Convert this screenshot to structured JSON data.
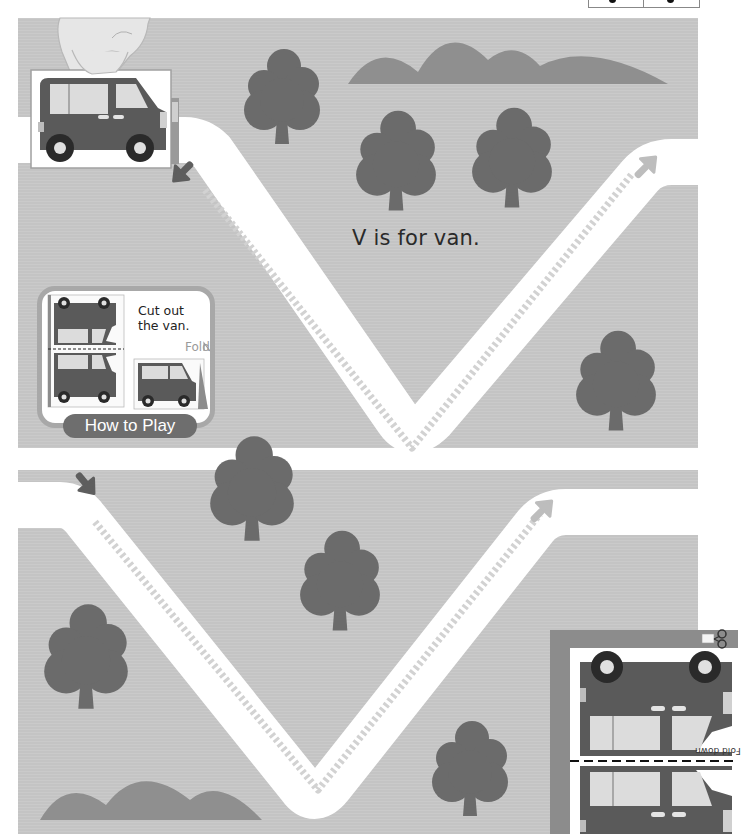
{
  "page": {
    "tagline": "V is for van.",
    "header_marks": [
      "dot-left",
      "dot-right"
    ]
  },
  "how_to_play": {
    "title": "How to Play",
    "instruction_line1": "Cut out",
    "instruction_line2": "the van.",
    "fold_label": "Fold"
  },
  "cutout": {
    "fold_instruction": "Fold down",
    "scissors_icon": "scissors-icon"
  },
  "colors": {
    "paper": "#ffffff",
    "ground": "#c4c4c4",
    "road": "#ffffff",
    "road_dash": "#d2d2d2",
    "tree": "#6b6b6b",
    "hill": "#8f8f8f",
    "van_body": "#5a5a5a",
    "van_window": "#dcdcdc",
    "arrow_start": "#5e5e5e",
    "arrow_end": "#bdbdbd",
    "card_border": "#a8a8a8",
    "cutout_frame": "#8c8c8c"
  },
  "map": {
    "upper_ground": {
      "x": 18,
      "y": 18,
      "w": 680,
      "h": 430
    },
    "lower_ground": {
      "x": 18,
      "y": 470,
      "w": 680,
      "h": 364
    },
    "upper_road": "M0,140 L185,140 Q200,140 212,152 L398,420 Q412,440 432,420 L640,176 Q652,162 672,162 L738,162",
    "lower_road": "M0,505 L60,505 Q75,505 86,520 L300,786 Q314,806 330,786 L534,528 Q546,512 566,512 L738,512",
    "upper_dashes": "M205,190 L412,448 L632,174",
    "lower_dashes": "M95,522 L318,790 L540,514",
    "trees": [
      {
        "cx": 282,
        "cy": 96,
        "s": 1.0
      },
      {
        "cx": 396,
        "cy": 160,
        "s": 1.05
      },
      {
        "cx": 512,
        "cy": 157,
        "s": 1.05
      },
      {
        "cx": 616,
        "cy": 380,
        "s": 1.05
      },
      {
        "cx": 252,
        "cy": 488,
        "s": 1.1
      },
      {
        "cx": 340,
        "cy": 580,
        "s": 1.05
      },
      {
        "cx": 86,
        "cy": 656,
        "s": 1.1
      },
      {
        "cx": 470,
        "cy": 768,
        "s": 1.0
      }
    ],
    "hills": [
      {
        "path": "M348,84 Q378,38 418,72 Q448,20 488,60 Q515,38 540,66 Q590,40 668,84 Z"
      },
      {
        "path": "M40,820 Q66,775 106,805 Q140,760 190,800 Q220,775 262,820 Z"
      }
    ]
  }
}
